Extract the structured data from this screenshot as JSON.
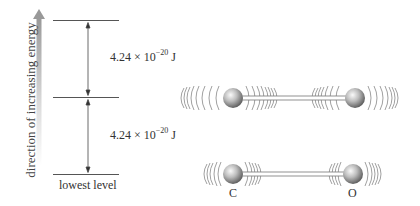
{
  "diagram": {
    "axis_label": "direction of increasing energy",
    "levels": [
      {
        "name": "level-2",
        "y": 20
      },
      {
        "name": "level-1",
        "y": 97
      },
      {
        "name": "lowest",
        "y": 174,
        "label": "lowest level"
      }
    ],
    "energy_gaps": [
      {
        "mantissa": "4.24 × 10",
        "exponent": "−20",
        "unit": " J"
      },
      {
        "mantissa": "4.24 × 10",
        "exponent": "−20",
        "unit": " J"
      }
    ],
    "molecules": [
      {
        "name": "excited-vibration",
        "atoms": [
          "",
          ""
        ]
      },
      {
        "name": "ground-vibration",
        "atoms": [
          "C",
          "O"
        ]
      }
    ],
    "colors": {
      "line": "#555555",
      "arrow_gray": "#9a9a9a",
      "atom_light": "#eeeeee",
      "atom_dark": "#6a6a6a"
    }
  }
}
